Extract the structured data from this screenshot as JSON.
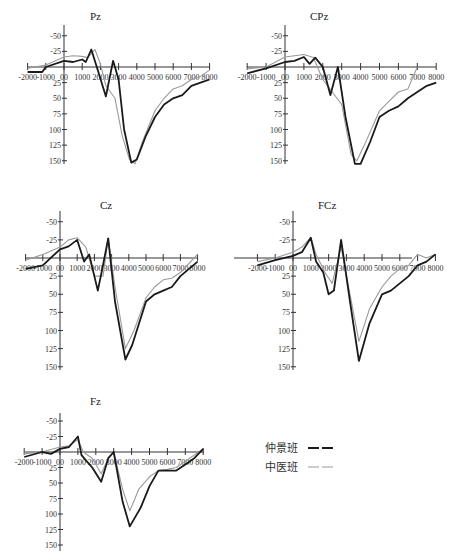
{
  "legend": {
    "items": [
      {
        "label": "仲景班",
        "color": "#1a1a1a",
        "style": "dashed-bold"
      },
      {
        "label": "中医班",
        "color": "#9a9a9a",
        "style": "dashed-light"
      }
    ]
  },
  "panels_layout": [
    {
      "id": "Pz",
      "x0": 64,
      "yaxis": 67,
      "xs": 18.2,
      "ys": 0.625,
      "ytop": 35,
      "ybot": 160,
      "xmin": 28,
      "xmax": 210,
      "titleX": 90,
      "titleY": 20
    },
    {
      "id": "CPz",
      "x0": 285,
      "yaxis": 67,
      "xs": 18.9,
      "ys": 0.625,
      "ytop": 35,
      "ybot": 160,
      "xmin": 247,
      "xmax": 436,
      "titleX": 310,
      "titleY": 20
    },
    {
      "id": "Cz",
      "x0": 60,
      "yaxis": 258,
      "xs": 17.2,
      "ys": 0.725,
      "ytop": 221,
      "ybot": 366,
      "xmin": 25,
      "xmax": 197,
      "titleX": 100,
      "titleY": 209
    },
    {
      "id": "FCz",
      "x0": 293,
      "yaxis": 258,
      "xs": 17.8,
      "ys": 0.725,
      "ytop": 221,
      "ybot": 366,
      "xmin": 234,
      "xmax": 412,
      "titleX": 318,
      "titleY": 209
    },
    {
      "id": "Fz",
      "x0": 60,
      "yaxis": 452,
      "xs": 17.9,
      "ys": 0.62,
      "ytop": 423,
      "ybot": 547,
      "xmin": 25,
      "xmax": 204,
      "titleX": 90,
      "titleY": 405
    }
  ],
  "chart_data": [
    {
      "type": "line",
      "title": "Pz",
      "x_ticks": [
        "-2000",
        "-1000",
        "00",
        "1000",
        "2000",
        "3000",
        "4000",
        "5000",
        "6000",
        "7000",
        "8000"
      ],
      "y_ticks": [
        "-50",
        "-25",
        "25",
        "50",
        "75",
        "100",
        "125",
        "150"
      ],
      "ylim": [
        -50,
        150
      ],
      "xlim": [
        -2000,
        8000
      ],
      "series": [
        {
          "name": "仲景班",
          "x": [
            -2000,
            -1200,
            -1000,
            0,
            500,
            1000,
            1200,
            1500,
            1800,
            2300,
            2700,
            3000,
            3300,
            3700,
            4000,
            4500,
            5000,
            5500,
            6000,
            6500,
            7000,
            7500,
            8000
          ],
          "values": [
            8,
            8,
            0,
            -10,
            -8,
            -12,
            -8,
            -28,
            0,
            47,
            -10,
            20,
            100,
            153,
            148,
            110,
            80,
            60,
            50,
            45,
            30,
            25,
            20
          ]
        },
        {
          "name": "中医班",
          "x": [
            -2000,
            -1000,
            0,
            500,
            1000,
            1300,
            1700,
            2000,
            2300,
            2800,
            3200,
            3600,
            3900,
            4300,
            5000,
            5500,
            6000,
            6500,
            7000,
            7500,
            8000
          ],
          "values": [
            2,
            -3,
            -16,
            -18,
            -17,
            -15,
            -28,
            -5,
            30,
            50,
            110,
            148,
            155,
            120,
            70,
            50,
            35,
            30,
            20,
            15,
            5
          ]
        }
      ]
    },
    {
      "type": "line",
      "title": "CPz",
      "x_ticks": [
        "-2000",
        "-1000",
        "00",
        "1000",
        "2000",
        "3000",
        "4000",
        "5000",
        "6000",
        "7000",
        "8000"
      ],
      "y_ticks": [
        "-50",
        "-25",
        "25",
        "50",
        "75",
        "100",
        "125",
        "150"
      ],
      "ylim": [
        -50,
        150
      ],
      "xlim": [
        -2000,
        8000
      ],
      "series": [
        {
          "name": "仲景班",
          "x": [
            -2000,
            -1000,
            0,
            500,
            1000,
            1300,
            1600,
            2000,
            2400,
            2800,
            3200,
            3700,
            4000,
            4500,
            5000,
            5500,
            6000,
            6500,
            7000,
            7500,
            8000
          ],
          "values": [
            10,
            2,
            -8,
            -10,
            -16,
            -5,
            -15,
            0,
            45,
            0,
            80,
            155,
            155,
            120,
            80,
            70,
            63,
            50,
            40,
            30,
            25
          ]
        },
        {
          "name": "中医班",
          "x": [
            -2000,
            -1000,
            0,
            500,
            1000,
            1500,
            2000,
            2500,
            3000,
            3500,
            3800,
            4200,
            5000,
            5500,
            6000,
            6500,
            7000
          ],
          "values": [
            3,
            0,
            -16,
            -18,
            -20,
            -15,
            20,
            40,
            60,
            140,
            150,
            125,
            70,
            55,
            40,
            35,
            0
          ]
        }
      ]
    },
    {
      "type": "line",
      "title": "Cz",
      "x_ticks": [
        "-2000",
        "-1000",
        "00",
        "1000",
        "2000",
        "3000",
        "4000",
        "5000",
        "6000",
        "7000",
        "8000"
      ],
      "y_ticks": [
        "-50",
        "-25",
        "25",
        "50",
        "75",
        "100",
        "125",
        "150"
      ],
      "ylim": [
        -50,
        150
      ],
      "xlim": [
        -2000,
        8000
      ],
      "series": [
        {
          "name": "仲景班",
          "x": [
            -2000,
            -1000,
            0,
            500,
            1000,
            1400,
            1700,
            2200,
            2500,
            2800,
            3200,
            3800,
            4200,
            5000,
            5500,
            6000,
            6500,
            7000,
            7500,
            8000
          ],
          "values": [
            15,
            10,
            -12,
            -16,
            -25,
            5,
            -5,
            45,
            10,
            -27,
            60,
            140,
            120,
            60,
            50,
            45,
            40,
            25,
            15,
            5
          ]
        },
        {
          "name": "中医班",
          "x": [
            -2000,
            -1000,
            0,
            500,
            1000,
            1500,
            2000,
            2500,
            2800,
            3200,
            3800,
            4300,
            5000,
            5500,
            6000,
            6500,
            7000,
            8000
          ],
          "values": [
            3,
            -5,
            -15,
            -25,
            -28,
            -15,
            25,
            25,
            -27,
            40,
            125,
            100,
            55,
            40,
            30,
            28,
            20,
            -5
          ]
        }
      ]
    },
    {
      "type": "line",
      "title": "FCz",
      "x_ticks": [
        "-2000",
        "-1000",
        "00",
        "1000",
        "2000",
        "3000",
        "4000",
        "5000",
        "6000",
        "7000",
        "8000"
      ],
      "y_ticks": [
        "-50",
        "-25",
        "25",
        "50",
        "75",
        "100",
        "125",
        "150"
      ],
      "ylim": [
        -50,
        150
      ],
      "xlim": [
        -2000,
        8000
      ],
      "series": [
        {
          "name": "仲景班",
          "x": [
            -2000,
            -1000,
            0,
            500,
            1000,
            1300,
            1700,
            2000,
            2300,
            2700,
            3200,
            3700,
            4300,
            5000,
            5500,
            6000,
            6500,
            7000,
            7500,
            8000
          ],
          "values": [
            10,
            3,
            -3,
            -8,
            -28,
            5,
            20,
            50,
            45,
            -25,
            60,
            142,
            90,
            50,
            45,
            35,
            25,
            10,
            5,
            -5
          ]
        },
        {
          "name": "中医班",
          "x": [
            -2000,
            -1000,
            0,
            500,
            1000,
            1300,
            1800,
            2200,
            2700,
            3200,
            3700,
            4300,
            5000,
            5500,
            6000,
            6500,
            7000,
            7500,
            8000
          ],
          "values": [
            5,
            0,
            -8,
            -15,
            -28,
            -5,
            20,
            35,
            -15,
            50,
            115,
            70,
            40,
            25,
            15,
            10,
            -5,
            0,
            -5
          ]
        }
      ]
    },
    {
      "type": "line",
      "title": "Fz",
      "x_ticks": [
        "-2000",
        "-1000",
        "00",
        "1000",
        "2000",
        "3000",
        "4000",
        "5000",
        "6000",
        "7000",
        "8000"
      ],
      "y_ticks": [
        "-50",
        "-25",
        "25",
        "50",
        "75",
        "100",
        "125",
        "150"
      ],
      "ylim": [
        -50,
        150
      ],
      "xlim": [
        -2000,
        8000
      ],
      "series": [
        {
          "name": "仲景班",
          "x": [
            -2000,
            -1000,
            -500,
            0,
            500,
            1000,
            1200,
            1500,
            1800,
            2300,
            2700,
            3000,
            3500,
            3900,
            4500,
            5000,
            5500,
            6000,
            6500,
            7000,
            7500,
            8000
          ],
          "values": [
            8,
            0,
            3,
            -5,
            -8,
            -25,
            5,
            15,
            25,
            48,
            10,
            0,
            80,
            120,
            90,
            55,
            30,
            30,
            30,
            20,
            10,
            -5
          ]
        },
        {
          "name": "中医班",
          "x": [
            -2000,
            -1000,
            0,
            500,
            1000,
            1300,
            1800,
            2300,
            2700,
            3000,
            3500,
            3900,
            4400,
            5000,
            5500,
            6000,
            6500,
            7000,
            8000
          ],
          "values": [
            3,
            0,
            -8,
            -10,
            -20,
            0,
            10,
            35,
            10,
            0,
            60,
            95,
            60,
            40,
            30,
            28,
            25,
            15,
            -5
          ]
        }
      ]
    }
  ]
}
